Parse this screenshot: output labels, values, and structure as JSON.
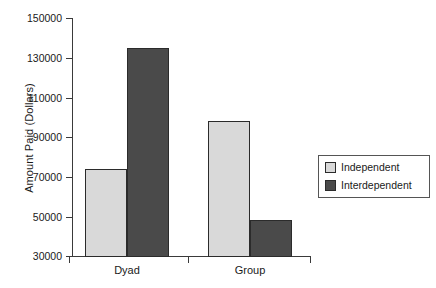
{
  "chart_data": {
    "type": "bar",
    "title": "",
    "subtitle": "",
    "xlabel": "",
    "ylabel": "Amount Paid (Dollars)",
    "categories": [
      "Dyad",
      "Group"
    ],
    "series": [
      {
        "name": "Independent",
        "values": [
          74000,
          98000
        ],
        "color": "#d9d9d9"
      },
      {
        "name": "Interdependent",
        "values": [
          135000,
          48000
        ],
        "color": "#4a4a4a"
      }
    ],
    "ylim": [
      30000,
      150000
    ],
    "yticks": [
      150000,
      130000,
      110000,
      90000,
      70000,
      50000,
      30000
    ],
    "ytick_labels": [
      "150000",
      "130000",
      "110000",
      "90000",
      "70000",
      "50000",
      "30000"
    ],
    "grid": false,
    "legend_position": "right",
    "legend_entries": [
      "Independent",
      "Interdependent"
    ]
  },
  "axis": {
    "y_label": "Amount Paid (Dollars)",
    "tick_0": "150000",
    "tick_1": "130000",
    "tick_2": "110000",
    "tick_3": "90000",
    "tick_4": "70000",
    "tick_5": "50000",
    "tick_6": "30000"
  },
  "categories": {
    "cat_0": "Dyad",
    "cat_1": "Group"
  },
  "legend": {
    "entry_0": "Independent",
    "entry_1": "Interdependent"
  }
}
